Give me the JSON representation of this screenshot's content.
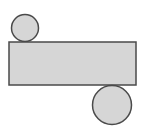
{
  "canvas": {
    "width": 143,
    "height": 136,
    "background_color": "#ffffff"
  },
  "style": {
    "fill_color": "#d6d6d6",
    "stroke_color": "#4a4a4a",
    "stroke_width": 1.5
  },
  "figure": {
    "shapes": [
      {
        "name": "top-left-circle",
        "type": "circle",
        "cx": 25,
        "cy": 28,
        "r": 13.5,
        "diameter": 27,
        "fill_color": "#d6d6d6",
        "stroke_color": "#4a4a4a"
      },
      {
        "name": "center-rectangle",
        "type": "rectangle",
        "x": 9,
        "y": 42,
        "width": 127,
        "height": 43,
        "fill_color": "#d6d6d6",
        "stroke_color": "#4a4a4a"
      },
      {
        "name": "bottom-right-circle",
        "type": "circle",
        "cx": 112,
        "cy": 105,
        "r": 19.5,
        "diameter": 39,
        "fill_color": "#d6d6d6",
        "stroke_color": "#4a4a4a"
      }
    ]
  }
}
